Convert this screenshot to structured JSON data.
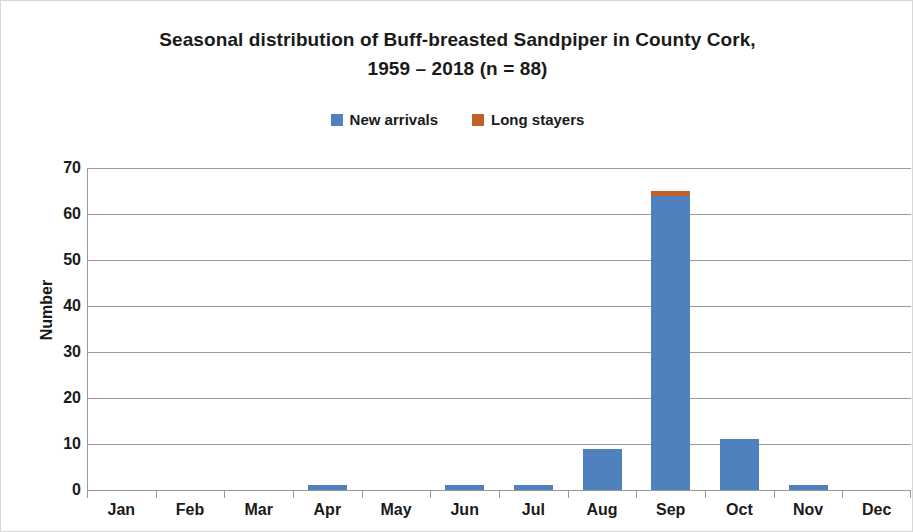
{
  "chart_data": {
    "type": "bar",
    "stacked": true,
    "title": "Seasonal distribution of Buff-breasted Sandpiper in County Cork, 1959 – 2018 (n = 88)",
    "title_line1": "Seasonal distribution of Buff-breasted Sandpiper in County Cork,",
    "title_line2": "1959 – 2018 (n = 88)",
    "xlabel": "",
    "ylabel": "Number",
    "ylim": [
      0,
      70
    ],
    "ytick_step": 10,
    "yticks": [
      70,
      60,
      50,
      40,
      30,
      20,
      10,
      0
    ],
    "grid": true,
    "legend_position": "top-center",
    "categories": [
      "Jan",
      "Feb",
      "Mar",
      "Apr",
      "May",
      "Jun",
      "Jul",
      "Aug",
      "Sep",
      "Oct",
      "Nov",
      "Dec"
    ],
    "series": [
      {
        "name": "New arrivals",
        "color": "#4E81BD",
        "values": [
          0,
          0,
          0,
          1,
          0,
          1,
          1,
          9,
          64,
          11,
          1,
          0
        ]
      },
      {
        "name": "Long stayers",
        "color": "#C0612B",
        "values": [
          0,
          0,
          0,
          0,
          0,
          0,
          0,
          0,
          1,
          0,
          0,
          0
        ]
      }
    ]
  },
  "legend": {
    "items": [
      {
        "label": "New arrivals",
        "color": "#4E81BD",
        "swatch_name": "legend-swatch-new-arrivals"
      },
      {
        "label": "Long stayers",
        "color": "#C0612B",
        "swatch_name": "legend-swatch-long-stayers"
      }
    ]
  }
}
